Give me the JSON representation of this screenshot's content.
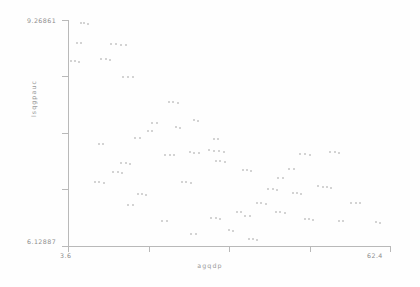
{
  "chart_data": {
    "type": "scatter",
    "title": "",
    "xlabel": "agqdp",
    "ylabel": "lsqgpauc",
    "xlim": [
      3.6,
      62.4
    ],
    "ylim": [
      6.12887,
      9.26861
    ],
    "grid": false,
    "legend": null,
    "marker_color": "#c4c4c4",
    "axis_color": "#b9b9b9",
    "text_color": "#8d8d8d",
    "xticks": [
      3.6,
      18.3,
      33.0,
      47.7,
      62.4
    ],
    "xticklabels": [
      "3.6",
      "",
      "",
      "",
      "62.4"
    ],
    "yticks": [
      6.12887,
      6.9139,
      7.69893,
      8.48396,
      9.26861
    ],
    "yticklabels": [
      "6.12887",
      "",
      "",
      "",
      "9.26861"
    ],
    "points": [
      [
        5.9,
        9.22
      ],
      [
        6.6,
        9.22
      ],
      [
        7.2,
        9.21
      ],
      [
        5.2,
        8.95
      ],
      [
        5.9,
        8.95
      ],
      [
        11.4,
        8.93
      ],
      [
        12.3,
        8.93
      ],
      [
        13.2,
        8.92
      ],
      [
        14.1,
        8.92
      ],
      [
        4.1,
        8.7
      ],
      [
        4.9,
        8.7
      ],
      [
        5.6,
        8.69
      ],
      [
        9.6,
        8.72
      ],
      [
        10.5,
        8.72
      ],
      [
        11.3,
        8.71
      ],
      [
        13.6,
        8.48
      ],
      [
        14.5,
        8.48
      ],
      [
        15.4,
        8.47
      ],
      [
        22.0,
        8.13
      ],
      [
        22.8,
        8.13
      ],
      [
        23.6,
        8.12
      ],
      [
        19.0,
        7.84
      ],
      [
        19.9,
        7.84
      ],
      [
        26.6,
        7.88
      ],
      [
        27.4,
        7.87
      ],
      [
        15.9,
        7.63
      ],
      [
        16.8,
        7.63
      ],
      [
        30.2,
        7.62
      ],
      [
        31.0,
        7.62
      ],
      [
        21.4,
        7.4
      ],
      [
        22.2,
        7.4
      ],
      [
        23.0,
        7.39
      ],
      [
        25.8,
        7.43
      ],
      [
        26.6,
        7.42
      ],
      [
        27.5,
        7.42
      ],
      [
        29.4,
        7.46
      ],
      [
        30.3,
        7.45
      ],
      [
        31.1,
        7.45
      ],
      [
        32.0,
        7.44
      ],
      [
        30.6,
        7.31
      ],
      [
        31.4,
        7.31
      ],
      [
        32.2,
        7.3
      ],
      [
        13.3,
        7.28
      ],
      [
        14.2,
        7.28
      ],
      [
        15.0,
        7.27
      ],
      [
        11.9,
        7.15
      ],
      [
        12.7,
        7.15
      ],
      [
        13.5,
        7.14
      ],
      [
        46.0,
        7.41
      ],
      [
        46.9,
        7.41
      ],
      [
        47.7,
        7.4
      ],
      [
        51.5,
        7.43
      ],
      [
        52.3,
        7.43
      ],
      [
        53.1,
        7.42
      ],
      [
        44.0,
        7.2
      ],
      [
        44.8,
        7.2
      ],
      [
        24.4,
        7.02
      ],
      [
        25.2,
        7.02
      ],
      [
        26.0,
        7.01
      ],
      [
        16.3,
        6.85
      ],
      [
        17.1,
        6.85
      ],
      [
        17.9,
        6.84
      ],
      [
        14.6,
        6.7
      ],
      [
        15.4,
        6.7
      ],
      [
        40.2,
        6.92
      ],
      [
        41.0,
        6.92
      ],
      [
        41.8,
        6.91
      ],
      [
        44.6,
        6.86
      ],
      [
        45.4,
        6.86
      ],
      [
        46.2,
        6.85
      ],
      [
        49.3,
        6.96
      ],
      [
        50.1,
        6.95
      ],
      [
        50.9,
        6.95
      ],
      [
        51.7,
        6.94
      ],
      [
        38.1,
        6.72
      ],
      [
        38.9,
        6.72
      ],
      [
        39.7,
        6.71
      ],
      [
        41.6,
        6.6
      ],
      [
        42.4,
        6.6
      ],
      [
        43.2,
        6.59
      ],
      [
        34.4,
        6.6
      ],
      [
        35.2,
        6.6
      ],
      [
        36.0,
        6.55
      ],
      [
        36.8,
        6.55
      ],
      [
        55.3,
        6.73
      ],
      [
        56.1,
        6.73
      ],
      [
        56.9,
        6.72
      ],
      [
        29.8,
        6.52
      ],
      [
        30.6,
        6.52
      ],
      [
        31.4,
        6.51
      ],
      [
        46.8,
        6.5
      ],
      [
        47.6,
        6.5
      ],
      [
        48.4,
        6.49
      ],
      [
        53.0,
        6.48
      ],
      [
        53.8,
        6.47
      ],
      [
        59.8,
        6.46
      ],
      [
        60.6,
        6.45
      ],
      [
        26.1,
        6.3
      ],
      [
        26.9,
        6.3
      ],
      [
        36.6,
        6.22
      ],
      [
        37.4,
        6.22
      ],
      [
        38.2,
        6.21
      ],
      [
        33.0,
        6.35
      ],
      [
        33.8,
        6.34
      ],
      [
        20.8,
        6.48
      ],
      [
        21.6,
        6.48
      ],
      [
        9.2,
        7.55
      ],
      [
        10.0,
        7.55
      ],
      [
        8.5,
        7.02
      ],
      [
        9.3,
        7.02
      ],
      [
        10.1,
        7.01
      ],
      [
        18.2,
        7.72
      ],
      [
        19.0,
        7.72
      ],
      [
        23.3,
        7.78
      ],
      [
        24.1,
        7.77
      ],
      [
        35.5,
        7.18
      ],
      [
        36.3,
        7.18
      ],
      [
        37.1,
        7.17
      ],
      [
        42.0,
        7.07
      ],
      [
        42.8,
        7.07
      ]
    ]
  },
  "axes": {
    "y_top_label": "9.26861",
    "y_bottom_label": "6.12887",
    "x_left_label": "3.6",
    "x_right_label": "62.4",
    "x_axis_title": "agqdp",
    "y_axis_title": "lsqgpauc"
  }
}
